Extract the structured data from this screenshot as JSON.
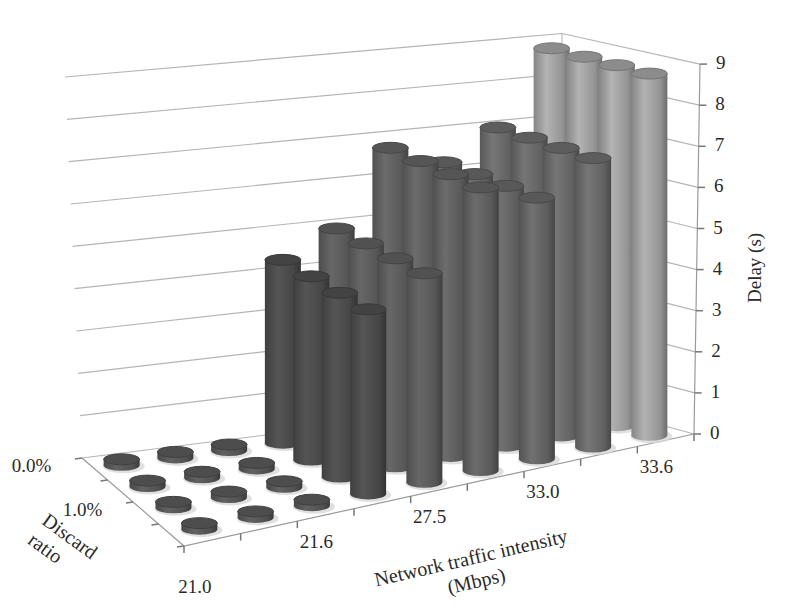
{
  "chart_data": {
    "type": "bar3d",
    "title": "",
    "xlabel": "Network traffic intensity (Mbps)",
    "xlabel_lines": [
      "Network traffic intensity",
      "(Mbps)"
    ],
    "zlabel": "Discard ratio",
    "zlabel_lines": [
      "Discard",
      "ratio"
    ],
    "ylabel": "Delay (s)",
    "ylim": [
      0,
      9
    ],
    "yticks": [
      "0",
      "1",
      "2",
      "3",
      "4",
      "5",
      "6",
      "7",
      "8",
      "9"
    ],
    "x_tick_labels": [
      "21.0",
      "21.6",
      "27.5",
      "33.0",
      "33.6"
    ],
    "x_tick_label_positions": [
      0,
      2,
      4,
      6,
      8
    ],
    "x_category_count": 9,
    "z_tick_labels": [
      "0.0%",
      "1.0%"
    ],
    "z_tick_label_positions": [
      0,
      2
    ],
    "z_row_count": 4,
    "bar_shape": "cylinder",
    "grid": true,
    "legend": "none",
    "series": [
      {
        "name": "row 1 (0.0%)",
        "values": [
          0,
          0,
          0,
          4.4,
          5.0,
          6.8,
          6.3,
          7.0,
          8.8
        ]
      },
      {
        "name": "row 2",
        "values": [
          0,
          0,
          0,
          4.4,
          5.0,
          6.8,
          6.3,
          7.0,
          8.8
        ]
      },
      {
        "name": "row 3 (1.0%)",
        "values": [
          0,
          0,
          0,
          4.4,
          5.0,
          6.8,
          6.3,
          7.0,
          8.8
        ]
      },
      {
        "name": "row 4",
        "values": [
          0,
          0,
          0,
          4.4,
          5.0,
          6.8,
          6.3,
          7.0,
          8.8
        ]
      }
    ],
    "column_colors": [
      "#555555",
      "#555555",
      "#555555",
      "#4a4a4a",
      "#5a5a5a",
      "#5e5e5e",
      "#626262",
      "#676767",
      "#9c9c9c"
    ]
  }
}
